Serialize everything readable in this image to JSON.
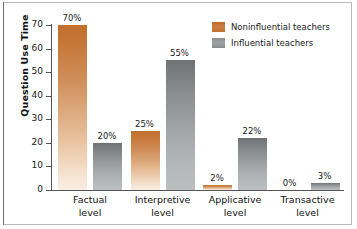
{
  "chart_data": {
    "type": "bar",
    "title": "",
    "xlabel": "",
    "ylabel": "Question Use Time",
    "ylim": [
      0,
      70
    ],
    "yticks": [
      0,
      10,
      20,
      30,
      40,
      50,
      60,
      70
    ],
    "ytick_labels": [
      "0",
      "10",
      "20",
      "30",
      "40",
      "50",
      "60",
      "70"
    ],
    "grid": false,
    "legend_position": "top-right",
    "categories": [
      "Factual\nlevel",
      "Interpretive\nlevel",
      "Applicative\nlevel",
      "Transactive\nlevel"
    ],
    "category_lines": [
      [
        "Factual",
        "level"
      ],
      [
        "Interpretive",
        "level"
      ],
      [
        "Applicative",
        "level"
      ],
      [
        "Transactive",
        "level"
      ]
    ],
    "series": [
      {
        "name": "Noninfluential teachers",
        "color": "#c2702f",
        "values": [
          70,
          25,
          2,
          0
        ],
        "labels": [
          "70%",
          "25%",
          "2%",
          "0%"
        ]
      },
      {
        "name": "Influential teachers",
        "color": "#8e9193",
        "values": [
          20,
          55,
          22,
          3
        ],
        "labels": [
          "20%",
          "55%",
          "22%",
          "3%"
        ]
      }
    ]
  },
  "legend": {
    "items": [
      {
        "label": "Noninfluential teachers",
        "swatch": "orange"
      },
      {
        "label": "Influential teachers",
        "swatch": "gray"
      }
    ]
  },
  "axis": {
    "y_title": "Question Use Time"
  }
}
